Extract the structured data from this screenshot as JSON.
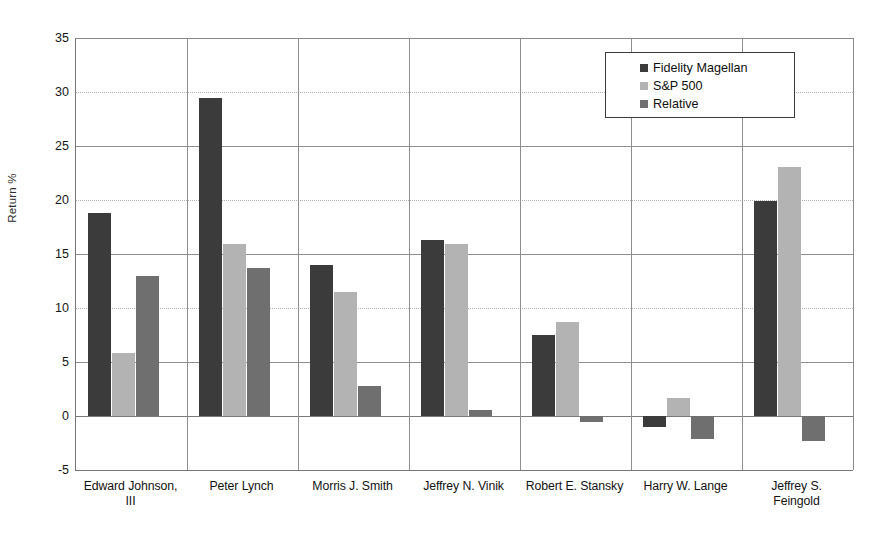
{
  "chart_data": {
    "type": "bar",
    "title": "",
    "xlabel": "",
    "ylabel": "Return %",
    "ylim": [
      -5,
      35
    ],
    "yticks": [
      -5,
      0,
      5,
      10,
      15,
      20,
      25,
      30,
      35
    ],
    "grid": true,
    "legend_position": "top-right",
    "categories": [
      "Edward Johnson, III",
      "Peter Lynch",
      "Morris J. Smith",
      "Jeffrey N. Vinik",
      "Robert E. Stansky",
      "Harry W. Lange",
      "Jeffrey S. Feingold"
    ],
    "series": [
      {
        "name": "Fidelity Magellan",
        "color": "#3b3b3b",
        "values": [
          18.8,
          29.4,
          14.0,
          16.3,
          7.5,
          -1.0,
          19.9
        ]
      },
      {
        "name": "S&P 500",
        "color": "#b3b3b3",
        "values": [
          5.8,
          15.9,
          11.5,
          15.9,
          8.7,
          1.7,
          23.1
        ]
      },
      {
        "name": "Relative",
        "color": "#6f6f6f",
        "values": [
          13.0,
          13.7,
          2.8,
          0.6,
          -0.6,
          -2.1,
          -2.3
        ]
      }
    ]
  },
  "legend": {
    "items": [
      {
        "label": "Fidelity Magellan",
        "color": "#3b3b3b"
      },
      {
        "label": "S&P 500",
        "color": "#b3b3b3"
      },
      {
        "label": "Relative",
        "color": "#6f6f6f"
      }
    ]
  },
  "axis": {
    "y_title": "Return %",
    "y_tick_labels": [
      "35",
      "30",
      "25",
      "20",
      "15",
      "10",
      "5",
      "0",
      "-5"
    ]
  },
  "category_labels": [
    {
      "line1": "Edward Johnson,",
      "line2": "III"
    },
    {
      "line1": "Peter Lynch",
      "line2": ""
    },
    {
      "line1": "Morris J. Smith",
      "line2": ""
    },
    {
      "line1": "Jeffrey N. Vinik",
      "line2": ""
    },
    {
      "line1": "Robert E. Stansky",
      "line2": ""
    },
    {
      "line1": "Harry W. Lange",
      "line2": ""
    },
    {
      "line1": "Jeffrey S.",
      "line2": "Feingold"
    }
  ]
}
